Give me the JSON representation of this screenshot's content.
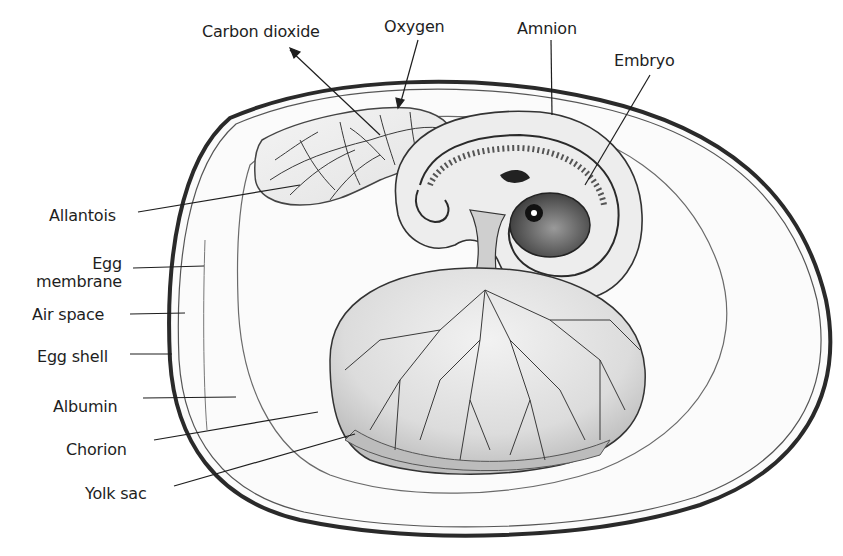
{
  "diagram": {
    "labels": {
      "carbon_dioxide": "Carbon dioxide",
      "oxygen": "Oxygen",
      "amnion": "Amnion",
      "embryo": "Embryo",
      "allantois": "Allantois",
      "egg_membrane_line1": "Egg",
      "egg_membrane_line2": "membrane",
      "air_space": "Air space",
      "egg_shell": "Egg shell",
      "albumin": "Albumin",
      "chorion": "Chorion",
      "yolk_sac": "Yolk sac"
    },
    "colors": {
      "background": "#ffffff",
      "ink": "#1e1e1e",
      "shell": "#2a2a2a",
      "yolk_fill": "#d9d9d9",
      "yolk_rim": "#bdbdbd",
      "vessel": "#3a3a3a",
      "embryo_fill": "#8a8a8a"
    }
  }
}
